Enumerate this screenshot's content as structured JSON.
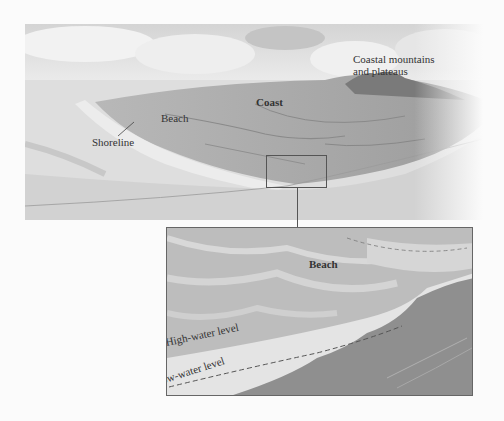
{
  "figure": {
    "main_scene": {
      "labels": {
        "coastal_mountains": "Coastal mountains",
        "coastal_mountains_line2": "and plateaus",
        "coast": "Coast",
        "beach": "Beach",
        "shoreline": "Shoreline"
      }
    },
    "inset": {
      "labels": {
        "beach": "Beach",
        "high_water": "High-water level",
        "low_water": "Low-water level"
      }
    },
    "colors": {
      "background": "#fbfbfb",
      "sky": "#dcdcdc",
      "land": "#a9a9a9",
      "water": "#d6d6d6",
      "deep_water": "#8e8e8e",
      "frame": "#555555"
    }
  }
}
